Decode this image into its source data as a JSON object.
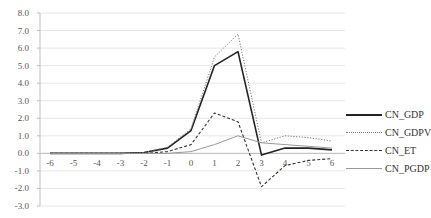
{
  "chart_data": {
    "type": "line",
    "title": "",
    "xlabel": "",
    "ylabel": "",
    "x": [
      -6,
      -5,
      -4,
      -3,
      -2,
      -1,
      0,
      1,
      2,
      3,
      4,
      5,
      6
    ],
    "x_tick_labels": [
      "-6",
      "-5",
      "-4",
      "-3",
      "-2",
      "-1",
      "0",
      "1",
      "2",
      "3",
      "4",
      "5",
      "6"
    ],
    "y_tick_labels": [
      "8.0",
      "7.0",
      "6.0",
      "5.0",
      "4.0",
      "3.0",
      "2.0",
      "1.0",
      "0.0",
      "-1.0",
      "-2.0",
      "-3.0"
    ],
    "ylim": [
      -3.0,
      8.0
    ],
    "grid": true,
    "legend_position": "right",
    "series": [
      {
        "name": "CN_GDP",
        "style": "solid-thick",
        "color": "#222222",
        "values": [
          0,
          0,
          0,
          0,
          0.05,
          0.3,
          1.3,
          5.0,
          5.8,
          -0.1,
          0.3,
          0.3,
          0.2
        ]
      },
      {
        "name": "CN_GDPV",
        "style": "dotted",
        "color": "#777777",
        "values": [
          0,
          0,
          0,
          0,
          0.05,
          0.35,
          1.4,
          5.5,
          6.8,
          0.6,
          1.0,
          0.9,
          0.7
        ]
      },
      {
        "name": "CN_ET",
        "style": "dashed",
        "color": "#333333",
        "values": [
          0,
          0,
          0,
          0,
          0.0,
          0.1,
          0.5,
          2.3,
          1.8,
          -1.9,
          -0.7,
          -0.4,
          -0.3
        ]
      },
      {
        "name": "CN_PGDP",
        "style": "solid-thin",
        "color": "#999999",
        "values": [
          0,
          0,
          0,
          0,
          0,
          0.0,
          0.1,
          0.5,
          1.0,
          0.6,
          0.5,
          0.4,
          0.3
        ]
      }
    ]
  },
  "legend": {
    "items": [
      {
        "label": "CN_GDP"
      },
      {
        "label": "CN_GDPV"
      },
      {
        "label": "CN_ET"
      },
      {
        "label": "CN_PGDP"
      }
    ]
  }
}
